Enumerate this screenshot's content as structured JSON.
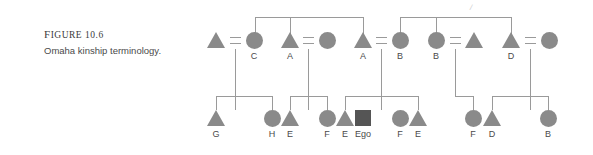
{
  "caption": {
    "figure_label_prefix": "F",
    "figure_label": "IGURE 10.6",
    "figure_number": "10.6",
    "title": "Omaha kinship terminology."
  },
  "colors": {
    "symbol_fill": "#8a8a8a",
    "ego_fill": "#555555",
    "line": "#9a9a9a",
    "text": "#4a4a4a"
  },
  "legend_meaning": {
    "triangle": "male",
    "circle": "female",
    "square": "ego",
    "equals": "marriage-link",
    "bar": "sibling-link"
  },
  "diagram": {
    "artifact_mark": "/",
    "generations": [
      {
        "name": "parent-generation",
        "symbols": [
          {
            "id": "p1",
            "shape": "triangle",
            "label": "",
            "x": 216,
            "y": 32
          },
          {
            "id": "p2",
            "shape": "circle",
            "label": "C",
            "x": 254,
            "y": 32
          },
          {
            "id": "p3",
            "shape": "triangle",
            "label": "A",
            "x": 290,
            "y": 32
          },
          {
            "id": "p4",
            "shape": "circle",
            "label": "",
            "x": 327,
            "y": 32
          },
          {
            "id": "p5",
            "shape": "triangle",
            "label": "A",
            "x": 363,
            "y": 32
          },
          {
            "id": "p6",
            "shape": "circle",
            "label": "B",
            "x": 400,
            "y": 32
          },
          {
            "id": "p7",
            "shape": "circle",
            "label": "B",
            "x": 436,
            "y": 32
          },
          {
            "id": "p8",
            "shape": "triangle",
            "label": "",
            "x": 474,
            "y": 32
          },
          {
            "id": "p9",
            "shape": "triangle",
            "label": "D",
            "x": 511,
            "y": 32
          },
          {
            "id": "p10",
            "shape": "circle",
            "label": "",
            "x": 549,
            "y": 32
          }
        ],
        "marriages": [
          {
            "left": "p1",
            "right": "p2",
            "x": 235
          },
          {
            "left": "p3",
            "right": "p4",
            "x": 308
          },
          {
            "left": "p5",
            "right": "p6",
            "x": 381
          },
          {
            "left": "p7",
            "right": "p8",
            "x": 455
          },
          {
            "left": "p9",
            "right": "p10",
            "x": 530
          }
        ],
        "sibling_bars": [
          {
            "from": 255,
            "to": 363,
            "drop": 290
          },
          {
            "from": 400,
            "to": 511,
            "drop": 436
          }
        ]
      },
      {
        "name": "ego-generation",
        "symbols": [
          {
            "id": "c1",
            "shape": "triangle",
            "label": "G",
            "x": 216,
            "y": 110
          },
          {
            "id": "c2",
            "shape": "circle",
            "label": "H",
            "x": 272,
            "y": 110
          },
          {
            "id": "c3",
            "shape": "triangle",
            "label": "E",
            "x": 290,
            "y": 110
          },
          {
            "id": "c4",
            "shape": "circle",
            "label": "F",
            "x": 327,
            "y": 110
          },
          {
            "id": "c5",
            "shape": "triangle",
            "label": "E",
            "x": 345,
            "y": 110
          },
          {
            "id": "c6",
            "shape": "square",
            "label": "Ego",
            "x": 363,
            "y": 110
          },
          {
            "id": "c7",
            "shape": "circle",
            "label": "F",
            "x": 400,
            "y": 110
          },
          {
            "id": "c8",
            "shape": "triangle",
            "label": "E",
            "x": 418,
            "y": 110
          },
          {
            "id": "c9",
            "shape": "circle",
            "label": "F",
            "x": 473,
            "y": 110
          },
          {
            "id": "c10",
            "shape": "triangle",
            "label": "D",
            "x": 492,
            "y": 110
          },
          {
            "id": "c11",
            "shape": "circle",
            "label": "B",
            "x": 548,
            "y": 110
          }
        ],
        "sibling_bars": [
          {
            "from": 216,
            "to": 272,
            "drop": 235
          },
          {
            "from": 290,
            "to": 327,
            "drop": 308
          },
          {
            "from": 345,
            "to": 418,
            "drop": 381
          },
          {
            "from": 473,
            "to": 473,
            "drop": 455
          },
          {
            "from": 492,
            "to": 548,
            "drop": 530
          }
        ]
      }
    ]
  }
}
